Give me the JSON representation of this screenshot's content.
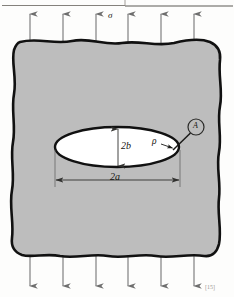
{
  "figure": {
    "domain_kind": "engineering-mechanics-diagram",
    "canvas": {
      "width": 234,
      "height": 297,
      "background": "#fdfdfc"
    },
    "page_header_text": "",
    "citation_marker": "[15]"
  },
  "labels": {
    "stress": "σ",
    "minor_axis": "2b",
    "major_axis": "2a",
    "tip_radius": "ρ",
    "detail_point": "A"
  },
  "plate": {
    "name": "cracked-plate",
    "fill_color": "#bdbdbd",
    "outline_color": "#111111",
    "outline_width_px": 2.6,
    "edge_style": "wavy-freehand",
    "bounds": {
      "left": 11,
      "top": 38,
      "right": 222,
      "bottom": 259
    }
  },
  "crack": {
    "name": "elliptical-crack",
    "shape": "ellipse",
    "fill_color": "#ffffff",
    "outline_color": "#111111",
    "outline_width_px": 2.4,
    "center": {
      "x": 117,
      "y": 147
    },
    "semi_major_a_px": 62,
    "semi_minor_b_px": 20
  },
  "load_arrows": {
    "color": "#6e6e6e",
    "top": {
      "name": "tension-arrows-top",
      "direction": "up",
      "count": 6,
      "x_positions": [
        30,
        63,
        96,
        128,
        161,
        194
      ],
      "tail_y": 44,
      "head_y": 12
    },
    "bottom": {
      "name": "tension-arrows-bottom",
      "direction": "down",
      "count": 6,
      "x_positions": [
        30,
        63,
        96,
        128,
        161,
        194
      ],
      "tail_y": 254,
      "head_y": 288
    }
  },
  "dimensions": {
    "major": {
      "name": "dimension-2a",
      "orientation": "horizontal",
      "y": 180,
      "x_start": 55,
      "x_end": 180,
      "label": "2a"
    },
    "minor": {
      "name": "dimension-2b",
      "orientation": "vertical",
      "x": 118,
      "y_start": 128,
      "y_end": 167,
      "label": "2b"
    },
    "extension_lines": {
      "color": "#5a5a5a",
      "width_px": 0.7
    }
  },
  "callout": {
    "name": "detail-callout-a",
    "circle_center": {
      "x": 196,
      "y": 127
    },
    "circle_radius_px": 8,
    "leader_from": {
      "x": 190,
      "y": 134
    },
    "leader_to": {
      "x": 172,
      "y": 150
    },
    "label": "A"
  },
  "tip_radius_indicator": {
    "name": "tip-radius-rho",
    "label": "ρ",
    "arrow_from": {
      "x": 161,
      "y": 144
    },
    "arrow_to": {
      "x": 173,
      "y": 148
    }
  }
}
